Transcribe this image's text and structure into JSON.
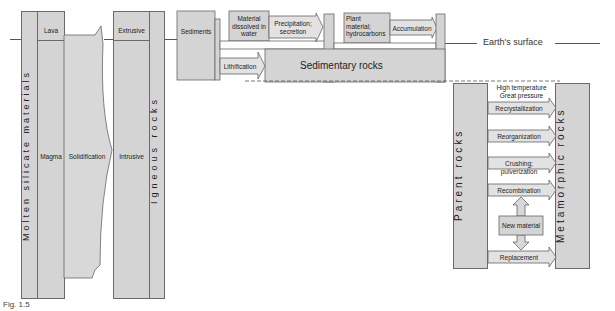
{
  "diagram": {
    "surface_label": "Earth's surface",
    "igneous": {
      "source_label": "Molten silicate materials",
      "lava": "Lava",
      "magma": "Magma",
      "process": "Solidification",
      "extrusive": "Extrusive",
      "intrusive": "Intrusive",
      "product_label": "Igneous rocks"
    },
    "sedimentary": {
      "sediments": "Sediments",
      "dissolved": "Material dissolved in water",
      "precipitation": "Precipitation; secretion",
      "plant": "Plant material; hydrocarbons",
      "accumulation": "Accumulation",
      "lithification": "Lithification",
      "product_label": "Sedimentary rocks"
    },
    "metamorphic": {
      "source_label": "Parent rocks",
      "conditions_1": "High temperature",
      "conditions_2": "Great pressure",
      "processes": [
        "Recrystallization",
        "Reorganization",
        "Crushing; pulverization",
        "Recombination",
        "Replacement"
      ],
      "new_material": "New material",
      "product_label": "Metamorphic rocks"
    },
    "caption": "Fig. 1.5"
  }
}
